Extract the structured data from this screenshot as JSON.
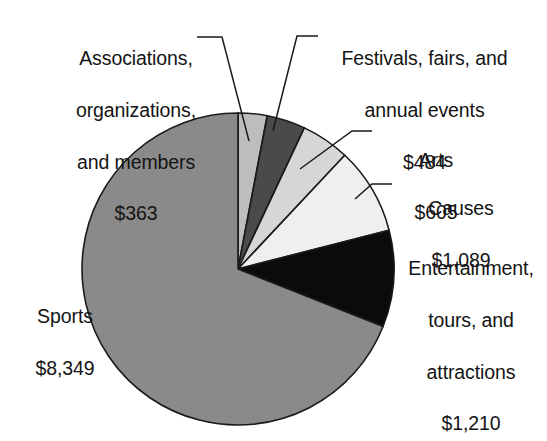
{
  "chart_data": {
    "type": "pie",
    "title": "",
    "subtitle": "",
    "units": "dollars",
    "total": 12100,
    "legend_position": "callout-labels",
    "grid": false,
    "categories": [
      "Sports",
      "Entertainment, tours, and attractions",
      "Causes",
      "Arts",
      "Festivals, fairs, and annual events",
      "Associations, organizations, and members"
    ],
    "values": [
      8349,
      1210,
      1089,
      605,
      484,
      363
    ],
    "value_labels": [
      "$8,349",
      "$1,210",
      "$1,089",
      "$605",
      "$484",
      "$363"
    ],
    "slices": [
      {
        "name": "Associations, organizations, and members",
        "value": 363,
        "value_label": "$363",
        "percent": 3.0,
        "color": "#bdbdbd",
        "start_angle_deg": -90,
        "end_angle_deg": -79.2
      },
      {
        "name": "Festivals, fairs, and annual events",
        "value": 484,
        "value_label": "$484",
        "percent": 4.0,
        "color": "#4a4a4a",
        "start_angle_deg": -79.2,
        "end_angle_deg": -64.8
      },
      {
        "name": "Arts",
        "value": 605,
        "value_label": "$605",
        "percent": 5.0,
        "color": "#d6d6d6",
        "start_angle_deg": -64.8,
        "end_angle_deg": -46.8
      },
      {
        "name": "Causes",
        "value": 1089,
        "value_label": "$1,089",
        "percent": 9.0,
        "color": "#efefef",
        "start_angle_deg": -46.8,
        "end_angle_deg": -14.4
      },
      {
        "name": "Entertainment, tours, and attractions",
        "value": 1210,
        "value_label": "$1,210",
        "percent": 10.0,
        "color": "#0b0b0b",
        "start_angle_deg": -14.4,
        "end_angle_deg": 21.6
      },
      {
        "name": "Sports",
        "value": 8349,
        "value_label": "$8,349",
        "percent": 69.0,
        "color": "#8a8a8a",
        "start_angle_deg": 21.6,
        "end_angle_deg": 270
      }
    ],
    "geometry": {
      "center_x": 238,
      "center_y": 269,
      "radius": 156,
      "stroke_color": "#1a1a1a",
      "stroke_width": 1.6,
      "background": "#ffffff"
    }
  },
  "labels": {
    "associations": {
      "line1": "Associations,",
      "line2": "organizations,",
      "line3": "and members",
      "value": "$363"
    },
    "festivals": {
      "line1": "Festivals, fairs, and",
      "line2": "annual events",
      "value": "$484"
    },
    "arts": {
      "line1": "Arts",
      "value": "$605"
    },
    "causes": {
      "line1": "Causes",
      "value": "$1,089"
    },
    "entertainment": {
      "line1": "Entertainment,",
      "line2": "tours, and",
      "line3": "attractions",
      "value": "$1,210"
    },
    "sports": {
      "line1": "Sports",
      "value": "$8,349"
    }
  }
}
